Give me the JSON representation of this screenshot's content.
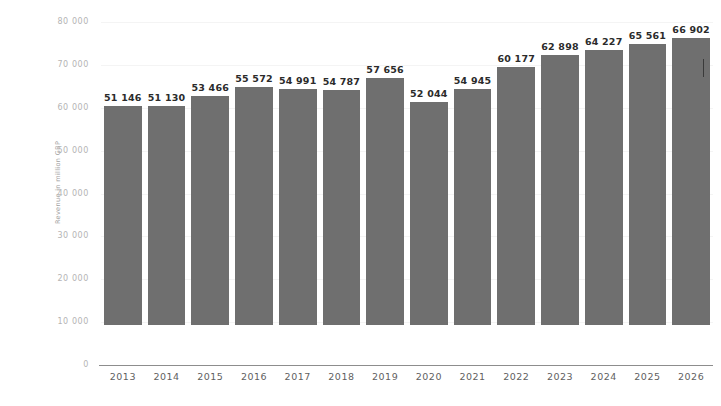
{
  "chart_data": {
    "type": "bar",
    "title": "",
    "subtitle": "",
    "xlabel": "",
    "ylabel": "Revenue in million GBP",
    "categories": [
      "2013",
      "2014",
      "2015",
      "2016",
      "2017",
      "2018",
      "2019",
      "2020",
      "2021",
      "2022",
      "2023",
      "2024",
      "2025",
      "2026"
    ],
    "values": [
      51146,
      51130,
      53466,
      55572,
      54991,
      54787,
      57656,
      52044,
      54945,
      60177,
      62898,
      64227,
      65561,
      66902
    ],
    "value_labels": [
      "51 146",
      "51 130",
      "53 466",
      "55 572",
      "54 991",
      "54 787",
      "57 656",
      "52 044",
      "54 945",
      "60 177",
      "62 898",
      "64 227",
      "65 561",
      "66 902"
    ],
    "ylim": [
      0,
      80000
    ],
    "y_ticks": [
      80000,
      70000,
      60000,
      50000,
      40000,
      30000,
      20000,
      10000,
      0
    ],
    "y_tick_labels": [
      "80 000",
      "70 000",
      "60 000",
      "50 000",
      "40 000",
      "30 000",
      "20 000",
      "10 000",
      "0"
    ],
    "grid": true,
    "grid_axis": "y",
    "legend": false,
    "legend_position": "none",
    "bar_color": "#6f6f6f",
    "background_color": "#ffffff",
    "axis_line_color": "#8d8d8d",
    "value_label_color": "#2b2b2b",
    "tick_label_color": "#b4b4b4",
    "x_label_color": "#5f5f5f"
  }
}
